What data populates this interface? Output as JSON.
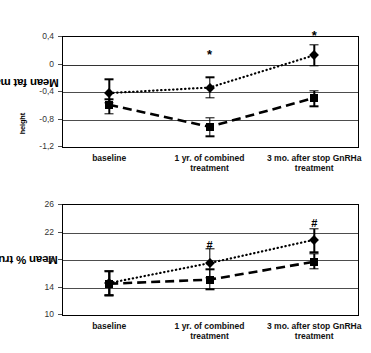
{
  "figure": {
    "panels": [
      "fat-mass-sds",
      "trunk-fat-percent"
    ]
  },
  "chart_data": [
    {
      "id": "fat-mass-sds",
      "type": "line",
      "title": "",
      "xlabel": "",
      "ylabel": "Mean fat mass SDS",
      "ylabel_sub": "height",
      "categories": [
        "baseline",
        "1 yr. of combined\ntreatment",
        "3 mo. after stop GnRHa\ntreatment"
      ],
      "ylim": [
        -1.2,
        0.4
      ],
      "yticks": [
        0.4,
        0,
        -0.4,
        -0.8,
        -1.2
      ],
      "ytick_labels": [
        "0,4",
        "0",
        "-0,4",
        "-0,8",
        "-1,2"
      ],
      "grid": true,
      "legend": "none",
      "series": [
        {
          "name": "dotted-diamond",
          "marker": "diamond",
          "linestyle": "dotted",
          "values": [
            -0.43,
            -0.35,
            0.12
          ],
          "err_low": [
            -0.57,
            -0.5,
            -0.03
          ],
          "err_high": [
            -0.23,
            -0.2,
            0.27
          ]
        },
        {
          "name": "dashed-square",
          "marker": "square",
          "linestyle": "dashed",
          "values": [
            -0.6,
            -0.92,
            -0.5
          ],
          "err_low": [
            -0.73,
            -1.06,
            -0.62
          ],
          "err_high": [
            -0.52,
            -0.79,
            -0.4
          ]
        }
      ],
      "annotations": [
        {
          "label": "*",
          "category_index": 1,
          "value": 0.14
        },
        {
          "label": "*",
          "category_index": 2,
          "value": 0.41
        }
      ]
    },
    {
      "id": "trunk-fat-percent",
      "type": "line",
      "title": "",
      "xlabel": "",
      "ylabel": "Mean % trunk fat",
      "ylabel_sub": "",
      "categories": [
        "baseline",
        "1 yr. of combined\ntreatment",
        "3 mo. after stop GnRHa\ntreatment"
      ],
      "ylim": [
        10,
        26
      ],
      "yticks": [
        26,
        22,
        18,
        14,
        10
      ],
      "ytick_labels": [
        "26",
        "22",
        "18",
        "14",
        "10"
      ],
      "grid": true,
      "legend": "none",
      "series": [
        {
          "name": "dotted-diamond",
          "marker": "diamond",
          "linestyle": "dotted",
          "values": [
            14.5,
            17.4,
            20.8
          ],
          "err_low": [
            12.7,
            15.3,
            19.0
          ],
          "err_high": [
            16.3,
            19.5,
            22.4
          ]
        },
        {
          "name": "dashed-square",
          "marker": "square",
          "linestyle": "dashed",
          "values": [
            14.4,
            15.0,
            17.6
          ],
          "err_low": [
            12.7,
            13.6,
            16.6
          ],
          "err_high": [
            16.2,
            16.5,
            18.8
          ]
        }
      ],
      "annotations": [
        {
          "label": "#",
          "category_index": 1,
          "value": 20.0
        },
        {
          "label": "#",
          "category_index": 2,
          "value": 23.3
        }
      ]
    }
  ]
}
